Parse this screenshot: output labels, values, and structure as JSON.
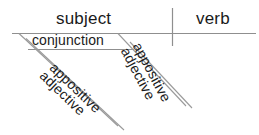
{
  "diagram": {
    "type": "reed-kellogg-sentence-diagram",
    "stroke_color": "#8a8a8a",
    "text_color": "#1a1a1a",
    "background_color": "#ffffff",
    "baseline": {
      "label_left": "subject",
      "label_right": "verb"
    },
    "branches": {
      "conjunction": "conjunction",
      "left_modifier_1": "appositive",
      "left_modifier_2": "adjective",
      "right_modifier_1": "appositive",
      "right_modifier_2": "adjective"
    }
  }
}
